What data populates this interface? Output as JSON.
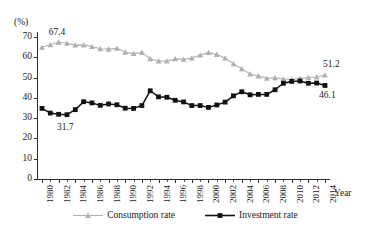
{
  "chart_data": {
    "type": "line",
    "title": "",
    "subtitle": "",
    "unit_label": "(%)",
    "xlabel": "Year",
    "ylabel": "",
    "grid": false,
    "legend_position": "bottom",
    "ylim": [
      0,
      70
    ],
    "ytick_values": [
      0,
      10,
      20,
      30,
      40,
      50,
      60,
      70
    ],
    "ytick_labels": [
      "0",
      "10",
      "20",
      "30",
      "40",
      "50",
      "60",
      "70"
    ],
    "xlim": [
      1980,
      2014
    ],
    "x": [
      1980,
      1981,
      1982,
      1983,
      1984,
      1985,
      1986,
      1987,
      1988,
      1989,
      1990,
      1991,
      1992,
      1993,
      1994,
      1995,
      1996,
      1997,
      1998,
      1999,
      2000,
      2001,
      2002,
      2003,
      2004,
      2005,
      2006,
      2007,
      2008,
      2009,
      2010,
      2011,
      2012,
      2013,
      2014
    ],
    "xtick_values": [
      1980,
      1982,
      1984,
      1986,
      1988,
      1990,
      1992,
      1994,
      1996,
      1998,
      2000,
      2002,
      2004,
      2006,
      2008,
      2010,
      2012,
      2014
    ],
    "xtick_labels": [
      "1980",
      "1982",
      "1984",
      "1986",
      "1988",
      "1990",
      "1992",
      "1994",
      "1996",
      "1998",
      "2000",
      "2002",
      "2004",
      "2006",
      "2008",
      "2010",
      "2012",
      "2014"
    ],
    "series": [
      {
        "name": "Consumption rate",
        "color": "#b0b0b0",
        "marker": "triangle",
        "values": [
          64.9,
          66.2,
          67.4,
          66.9,
          66.0,
          66.1,
          65.3,
          64.2,
          64.0,
          64.4,
          62.5,
          61.8,
          62.4,
          59.3,
          58.2,
          58.1,
          59.2,
          59.0,
          59.6,
          61.1,
          62.3,
          61.4,
          59.6,
          56.8,
          54.3,
          51.8,
          50.8,
          49.6,
          49.9,
          49.3,
          49.1,
          49.6,
          50.0,
          50.3,
          51.2
        ]
      },
      {
        "name": "Investment rate",
        "color": "#111111",
        "marker": "square",
        "values": [
          34.8,
          32.5,
          31.9,
          31.7,
          34.2,
          38.1,
          37.5,
          36.3,
          37.0,
          36.6,
          34.9,
          34.8,
          36.2,
          43.5,
          40.5,
          40.3,
          38.8,
          38.0,
          36.2,
          36.2,
          35.3,
          36.5,
          37.9,
          41.0,
          43.0,
          41.5,
          41.7,
          41.7,
          44.0,
          47.2,
          48.1,
          48.3,
          47.2,
          47.3,
          46.1
        ]
      }
    ],
    "annotations": [
      {
        "text": "67.4",
        "series": "Consumption rate",
        "x": 1982,
        "y": 67.4
      },
      {
        "text": "31.7",
        "series": "Investment rate",
        "x": 1983,
        "y": 31.7
      },
      {
        "text": "51.2",
        "series": "Consumption rate",
        "x": 2014,
        "y": 51.2
      },
      {
        "text": "46.1",
        "series": "Investment rate",
        "x": 2014,
        "y": 46.1
      }
    ]
  }
}
